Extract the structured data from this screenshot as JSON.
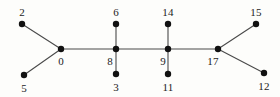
{
  "figure": {
    "kind": "node-link-tree-diagram",
    "width": 280,
    "height": 97,
    "background_color": "#fdfdfb",
    "node_color": "#111111",
    "edge_color": "#4a4a4a",
    "label_color": "#1b1b1b",
    "node_radius": 3.2,
    "edge_width": 1.1
  },
  "chart_data": {
    "type": "diagram",
    "title": "",
    "nodes": [
      {
        "id": "2",
        "label": "2",
        "x": 22,
        "y": 24,
        "label_x": 22,
        "label_y": 12
      },
      {
        "id": "5",
        "label": "5",
        "x": 24,
        "y": 75,
        "label_x": 24,
        "label_y": 88
      },
      {
        "id": "0",
        "label": "0",
        "x": 61,
        "y": 49,
        "label_x": 61,
        "label_y": 61
      },
      {
        "id": "6",
        "label": "6",
        "x": 116,
        "y": 24,
        "label_x": 116,
        "label_y": 12
      },
      {
        "id": "8",
        "label": "8",
        "x": 116,
        "y": 49,
        "label_x": 110,
        "label_y": 61
      },
      {
        "id": "3",
        "label": "3",
        "x": 116,
        "y": 74,
        "label_x": 116,
        "label_y": 87
      },
      {
        "id": "14",
        "label": "14",
        "x": 168,
        "y": 24,
        "label_x": 168,
        "label_y": 12
      },
      {
        "id": "9",
        "label": "9",
        "x": 168,
        "y": 49,
        "label_x": 163,
        "label_y": 61
      },
      {
        "id": "11",
        "label": "11",
        "x": 168,
        "y": 74,
        "label_x": 168,
        "label_y": 87
      },
      {
        "id": "17",
        "label": "17",
        "x": 218,
        "y": 49,
        "label_x": 213,
        "label_y": 61
      },
      {
        "id": "15",
        "label": "15",
        "x": 256,
        "y": 24,
        "label_x": 256,
        "label_y": 12
      },
      {
        "id": "12",
        "label": "12",
        "x": 264,
        "y": 73,
        "label_x": 264,
        "label_y": 86
      }
    ],
    "edges": [
      {
        "source": "2",
        "target": "0"
      },
      {
        "source": "5",
        "target": "0"
      },
      {
        "source": "0",
        "target": "8"
      },
      {
        "source": "6",
        "target": "8"
      },
      {
        "source": "8",
        "target": "3"
      },
      {
        "source": "8",
        "target": "9"
      },
      {
        "source": "14",
        "target": "9"
      },
      {
        "source": "9",
        "target": "11"
      },
      {
        "source": "9",
        "target": "17"
      },
      {
        "source": "17",
        "target": "15"
      },
      {
        "source": "17",
        "target": "12"
      }
    ]
  }
}
